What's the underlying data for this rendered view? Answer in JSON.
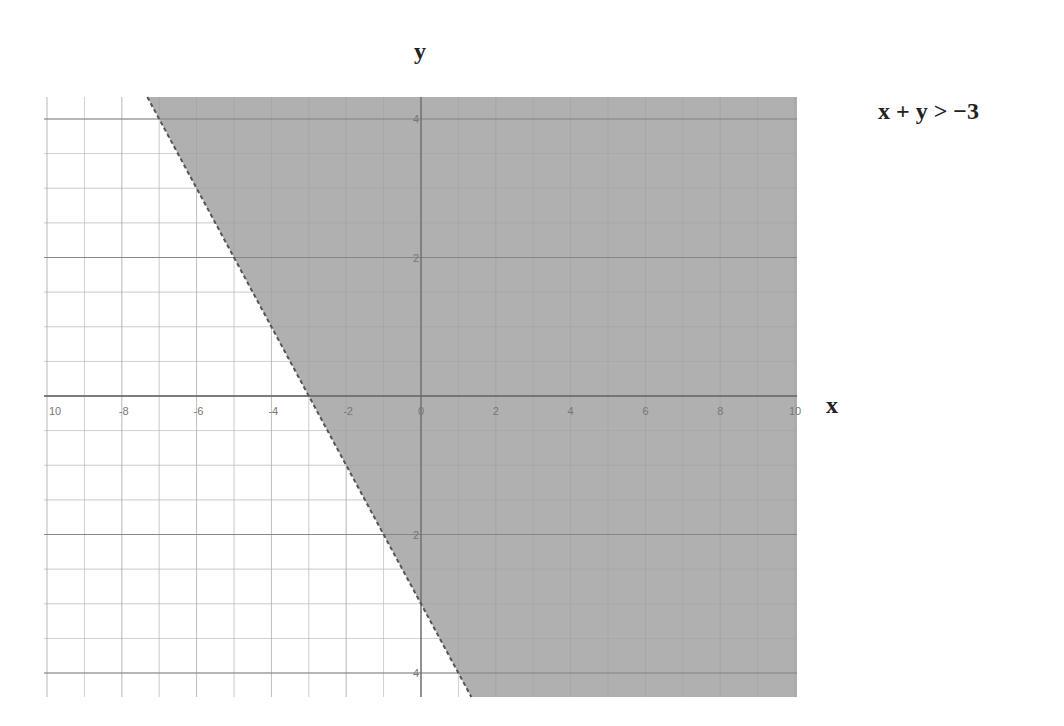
{
  "chart_data": {
    "type": "area",
    "title": "x + y > −3",
    "xlabel": "x",
    "ylabel": "y",
    "xlim": [
      -10,
      10
    ],
    "ylim": [
      -4.3,
      4.3
    ],
    "grid": true,
    "x_ticks": [
      -10,
      -8,
      -6,
      -4,
      -2,
      0,
      2,
      4,
      6,
      8,
      10
    ],
    "y_ticks": [
      4,
      2,
      -2,
      -4
    ],
    "x_tick_labels": [
      "10",
      "-8",
      "-6",
      "-4",
      "-2",
      "0",
      "2",
      "4",
      "6",
      "8",
      "10"
    ],
    "y_tick_labels": [
      "4",
      "2",
      "2",
      "4"
    ],
    "boundary_line": {
      "equation": "y = -x - 3",
      "style": "dashed",
      "points": [
        [
          -7.3,
          4.3
        ],
        [
          -3,
          0
        ],
        [
          1.3,
          -4.3
        ]
      ]
    },
    "shaded_region": "above boundary line (x + y > -3)",
    "shade_color": "#a8a8a8"
  },
  "labels": {
    "x_axis_title": "x",
    "y_axis_title": "y",
    "inequality": "x + y > −3"
  }
}
